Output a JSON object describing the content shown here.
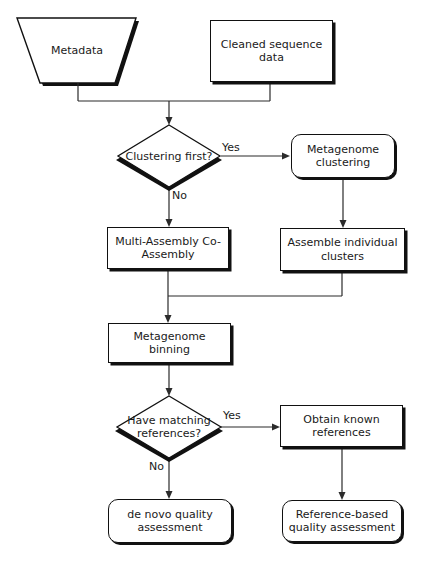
{
  "diagram": {
    "colors": {
      "stroke": "#111111",
      "fill": "#ffffff",
      "background": "#ffffff",
      "text": "#1a1a1a"
    },
    "nodes": {
      "metadata": {
        "label": "Metadata",
        "shape": "trapezoid"
      },
      "cleaned_sequence": {
        "label": "Cleaned sequence data",
        "shape": "rectangle"
      },
      "clustering_first": {
        "label": "Clustering first?",
        "shape": "diamond"
      },
      "metagenome_clustering": {
        "label": "Metagenome clustering",
        "shape": "rounded-rectangle"
      },
      "multi_assembly": {
        "label": "Multi-Assembly Co-Assembly",
        "shape": "rectangle"
      },
      "assemble_individual": {
        "label": "Assemble individual clusters",
        "shape": "rectangle"
      },
      "metagenome_binning": {
        "label": "Metagenome binning",
        "shape": "rectangle"
      },
      "have_matching_references": {
        "label": "Have matching references?",
        "shape": "diamond"
      },
      "obtain_known_references": {
        "label": "Obtain known references",
        "shape": "rectangle"
      },
      "de_novo_qa": {
        "label": "de novo quality assessment",
        "shape": "rounded-rectangle"
      },
      "reference_based_qa": {
        "label": "Reference-based quality assessment",
        "shape": "rounded-rectangle"
      }
    },
    "edge_labels": {
      "clustering_yes": "Yes",
      "clustering_no": "No",
      "references_yes": "Yes",
      "references_no": "No"
    }
  }
}
